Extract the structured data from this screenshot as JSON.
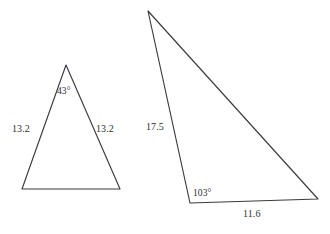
{
  "figure": {
    "kind": "geometry-diagram",
    "background_color": "#ffffff",
    "stroke_color": "#3a3a42",
    "text_color": "#2e2e33",
    "width": 330,
    "height": 234
  },
  "shapes": [
    {
      "id": "triangle-left",
      "name": "left-triangle",
      "type": "isosceles-triangle",
      "points": "66,65 22,189 120,189",
      "vertices": [
        {
          "name": "apex",
          "x": 66,
          "y": 65
        },
        {
          "name": "bottom-left",
          "x": 22,
          "y": 189
        },
        {
          "name": "bottom-right",
          "x": 120,
          "y": 189
        }
      ],
      "labels": {
        "apex_angle": "43°",
        "side_left": "13.2",
        "side_right": "13.2"
      }
    },
    {
      "id": "triangle-right",
      "name": "right-triangle",
      "type": "obtuse-triangle",
      "points": "148,11 190,203 318,199",
      "vertices": [
        {
          "name": "apex",
          "x": 148,
          "y": 11
        },
        {
          "name": "bottom-left",
          "x": 190,
          "y": 203
        },
        {
          "name": "bottom-right",
          "x": 318,
          "y": 199
        }
      ],
      "labels": {
        "side_left": "17.5",
        "bottom_left_angle": "103°",
        "side_base": "11.6"
      }
    }
  ],
  "chart_data": {
    "type": "table",
    "title": "",
    "categories": [
      "Left triangle",
      "Right triangle"
    ],
    "series": [
      {
        "name": "Left triangle",
        "measures": [
          {
            "label": "apex angle",
            "value": 43,
            "unit": "degrees",
            "text": "43°"
          },
          {
            "label": "left side",
            "value": 13.2,
            "unit": "",
            "text": "13.2"
          },
          {
            "label": "right side",
            "value": 13.2,
            "unit": "",
            "text": "13.2"
          }
        ]
      },
      {
        "name": "Right triangle",
        "measures": [
          {
            "label": "left side",
            "value": 17.5,
            "unit": "",
            "text": "17.5"
          },
          {
            "label": "bottom-left angle",
            "value": 103,
            "unit": "degrees",
            "text": "103°"
          },
          {
            "label": "base side",
            "value": 11.6,
            "unit": "",
            "text": "11.6"
          }
        ]
      }
    ]
  }
}
